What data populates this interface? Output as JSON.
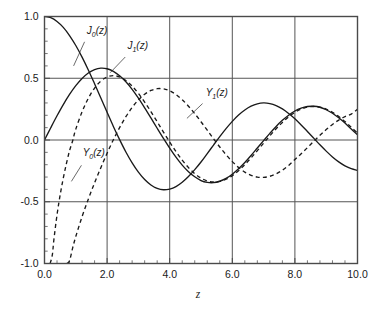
{
  "chart_data": {
    "type": "line",
    "title": "",
    "subtitle": "",
    "xlabel": "z",
    "ylabel": "",
    "xlim": [
      0.0,
      10.0
    ],
    "ylim": [
      -1.0,
      1.0
    ],
    "grid": true,
    "legend_position": "inline-annotations",
    "x_ticks": [
      "0.0",
      "2.0",
      "4.0",
      "6.0",
      "8.0",
      "10.0"
    ],
    "x_tick_values": [
      0.0,
      2.0,
      4.0,
      6.0,
      8.0,
      10.0
    ],
    "x_minor_tick_step": 0.4,
    "y_ticks": [
      "1.0",
      "0.5",
      "0.0",
      "-0.5",
      "-1.0"
    ],
    "y_tick_values": [
      1.0,
      0.5,
      0.0,
      -0.5,
      -1.0
    ],
    "y_minor_tick_step": 0.1,
    "annotations": [
      {
        "name": "J0",
        "text": "J",
        "sub": "0",
        "suffix": "(z)",
        "x": 1.35,
        "y": 0.86
      },
      {
        "name": "J1",
        "text": "J",
        "sub": "1",
        "suffix": "(z)",
        "x": 2.65,
        "y": 0.74
      },
      {
        "name": "Y1",
        "text": "Y",
        "sub": "1",
        "suffix": "(z)",
        "x": 5.15,
        "y": 0.36
      },
      {
        "name": "Y0",
        "text": "Y",
        "sub": "0",
        "suffix": "(z)",
        "x": 1.22,
        "y": -0.13
      }
    ],
    "series": [
      {
        "name": "J0(z)",
        "label": "J_0(z)",
        "style": "solid",
        "color": "#1a1a1a",
        "x": [
          0.0,
          0.2,
          0.4,
          0.6,
          0.8,
          1.0,
          1.2,
          1.4,
          1.6,
          1.8,
          2.0,
          2.2,
          2.4,
          2.6,
          2.8,
          3.0,
          3.2,
          3.4,
          3.6,
          3.8,
          4.0,
          4.2,
          4.4,
          4.6,
          4.8,
          5.0,
          5.2,
          5.4,
          5.6,
          5.8,
          6.0,
          6.2,
          6.4,
          6.6,
          6.8,
          7.0,
          7.2,
          7.4,
          7.6,
          7.8,
          8.0,
          8.2,
          8.4,
          8.6,
          8.8,
          9.0,
          9.2,
          9.4,
          9.6,
          9.8,
          10.0
        ],
        "y": [
          1.0,
          0.99,
          0.96,
          0.912,
          0.846,
          0.765,
          0.671,
          0.567,
          0.455,
          0.34,
          0.224,
          0.11,
          0.003,
          -0.097,
          -0.185,
          -0.26,
          -0.32,
          -0.364,
          -0.392,
          -0.403,
          -0.397,
          -0.377,
          -0.342,
          -0.296,
          -0.24,
          -0.178,
          -0.11,
          -0.041,
          0.027,
          0.092,
          0.151,
          0.202,
          0.243,
          0.274,
          0.293,
          0.3,
          0.295,
          0.279,
          0.252,
          0.215,
          0.172,
          0.122,
          0.069,
          0.015,
          -0.039,
          -0.09,
          -0.137,
          -0.177,
          -0.209,
          -0.232,
          -0.246
        ]
      },
      {
        "name": "J1(z)",
        "label": "J_1(z)",
        "style": "solid",
        "color": "#1a1a1a",
        "x": [
          0.0,
          0.2,
          0.4,
          0.6,
          0.8,
          1.0,
          1.2,
          1.4,
          1.6,
          1.8,
          2.0,
          2.2,
          2.4,
          2.6,
          2.8,
          3.0,
          3.2,
          3.4,
          3.6,
          3.8,
          4.0,
          4.2,
          4.4,
          4.6,
          4.8,
          5.0,
          5.2,
          5.4,
          5.6,
          5.8,
          6.0,
          6.2,
          6.4,
          6.6,
          6.8,
          7.0,
          7.2,
          7.4,
          7.6,
          7.8,
          8.0,
          8.2,
          8.4,
          8.6,
          8.8,
          9.0,
          9.2,
          9.4,
          9.6,
          9.8,
          10.0
        ],
        "y": [
          0.0,
          0.0995,
          0.196,
          0.287,
          0.369,
          0.44,
          0.498,
          0.542,
          0.57,
          0.582,
          0.577,
          0.556,
          0.52,
          0.471,
          0.41,
          0.339,
          0.261,
          0.179,
          0.095,
          0.013,
          -0.066,
          -0.139,
          -0.203,
          -0.257,
          -0.298,
          -0.328,
          -0.343,
          -0.345,
          -0.334,
          -0.311,
          -0.277,
          -0.233,
          -0.182,
          -0.125,
          -0.065,
          -0.005,
          0.054,
          0.11,
          0.159,
          0.201,
          0.235,
          0.258,
          0.271,
          0.273,
          0.265,
          0.245,
          0.217,
          0.18,
          0.137,
          0.089,
          0.043
        ]
      },
      {
        "name": "Y0(z)",
        "label": "Y_0(z)",
        "style": "dashed",
        "color": "#1a1a1a",
        "x": [
          0.18,
          0.25,
          0.3,
          0.4,
          0.5,
          0.6,
          0.7,
          0.8,
          0.9,
          1.0,
          1.2,
          1.4,
          1.6,
          1.8,
          2.0,
          2.2,
          2.4,
          2.6,
          2.8,
          3.0,
          3.2,
          3.4,
          3.6,
          3.8,
          4.0,
          4.2,
          4.4,
          4.6,
          4.8,
          5.0,
          5.2,
          5.4,
          5.6,
          5.8,
          6.0,
          6.2,
          6.4,
          6.6,
          6.8,
          7.0,
          7.2,
          7.4,
          7.6,
          7.8,
          8.0,
          8.2,
          8.4,
          8.6,
          8.8,
          9.0,
          9.2,
          9.4,
          9.6,
          9.8,
          10.0
        ],
        "y": [
          -1.0,
          -0.931,
          -0.807,
          -0.606,
          -0.445,
          -0.309,
          -0.191,
          -0.0868,
          -0.0056,
          0.0883,
          0.2281,
          0.3379,
          0.4204,
          0.4774,
          0.5104,
          0.5208,
          0.5104,
          0.4813,
          0.4359,
          0.3769,
          0.3071,
          0.2296,
          0.1477,
          0.0645,
          -0.0169,
          -0.0938,
          -0.1633,
          -0.2235,
          -0.2723,
          -0.3085,
          -0.3313,
          -0.3403,
          -0.3354,
          -0.3177,
          -0.2882,
          -0.2483,
          -0.2,
          -0.1452,
          -0.0864,
          -0.0259,
          0.0339,
          0.0907,
          0.1424,
          0.1872,
          0.2235,
          0.2501,
          0.2662,
          0.2715,
          0.2659,
          0.2499,
          0.2243,
          0.1903,
          0.1495,
          0.1037,
          0.0557
        ]
      },
      {
        "name": "Y1(z)",
        "label": "Y_1(z)",
        "style": "dashed",
        "color": "#1a1a1a",
        "x": [
          0.72,
          0.8,
          0.9,
          1.0,
          1.2,
          1.4,
          1.6,
          1.8,
          2.0,
          2.2,
          2.4,
          2.6,
          2.8,
          3.0,
          3.2,
          3.4,
          3.6,
          3.8,
          4.0,
          4.2,
          4.4,
          4.6,
          4.8,
          5.0,
          5.2,
          5.4,
          5.6,
          5.8,
          6.0,
          6.2,
          6.4,
          6.6,
          6.8,
          7.0,
          7.2,
          7.4,
          7.6,
          7.8,
          8.0,
          8.2,
          8.4,
          8.6,
          8.8,
          9.0,
          9.2,
          9.4,
          9.6,
          9.8,
          10.0
        ],
        "y": [
          -1.0,
          -0.978,
          -0.873,
          -0.781,
          -0.621,
          -0.479,
          -0.347,
          -0.224,
          -0.107,
          0.0015,
          0.1005,
          0.1884,
          0.2635,
          0.3247,
          0.3707,
          0.401,
          0.4154,
          0.4141,
          0.3979,
          0.368,
          0.326,
          0.2737,
          0.2136,
          0.1479,
          0.0792,
          0.0101,
          -0.0568,
          -0.1192,
          -0.175,
          -0.2223,
          -0.2596,
          -0.2857,
          -0.3001,
          -0.3027,
          -0.2936,
          -0.2737,
          -0.244,
          -0.206,
          -0.1581,
          -0.1116,
          -0.0617,
          -0.0112,
          0.038,
          0.0843,
          0.1258,
          0.1613,
          0.1895,
          0.2097,
          0.249
        ]
      }
    ]
  },
  "axes": {
    "x_title": "z"
  }
}
